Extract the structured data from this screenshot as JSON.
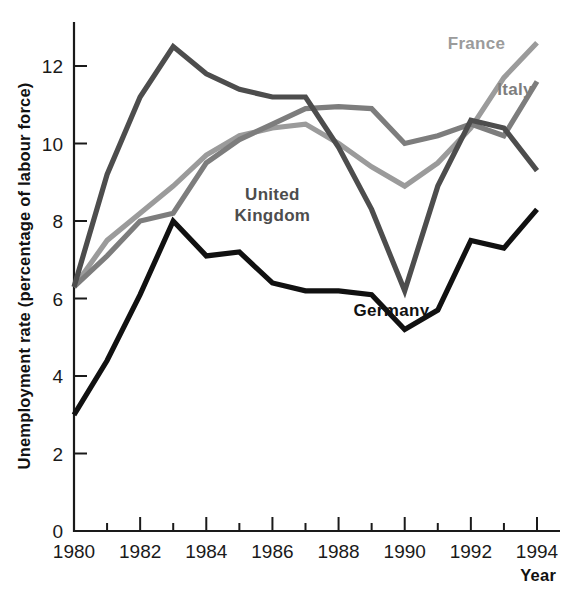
{
  "chart_data": {
    "type": "line",
    "title": "",
    "xlabel": "Year",
    "ylabel": "Unemployment rate (percentage of labour force)",
    "x": [
      1980,
      1981,
      1982,
      1983,
      1984,
      1985,
      1986,
      1987,
      1988,
      1989,
      1990,
      1991,
      1992,
      1993,
      1994
    ],
    "xlim": [
      1980,
      1994
    ],
    "ylim": [
      0,
      13
    ],
    "xticks": [
      1980,
      1982,
      1984,
      1986,
      1988,
      1990,
      1992,
      1994
    ],
    "xtick_labels": [
      "1980",
      "1982",
      "1984",
      "1986",
      "1988",
      "1990",
      "1992",
      "1994"
    ],
    "xticks_minor": [
      1981,
      1983,
      1985,
      1987,
      1989,
      1991,
      1993
    ],
    "yticks": [
      0,
      2,
      4,
      6,
      8,
      10,
      12
    ],
    "ytick_labels": [
      "0",
      "2",
      "4",
      "6",
      "8",
      "10",
      "12"
    ],
    "grid": false,
    "legend": "inline-annotations",
    "series": [
      {
        "name": "United Kingdom",
        "color": "#4d4d4d",
        "label_x": 1986.0,
        "label_y": 8.55,
        "values": [
          6.3,
          9.2,
          11.2,
          12.5,
          11.8,
          11.4,
          11.2,
          11.2,
          9.9,
          8.3,
          6.2,
          8.9,
          10.6,
          10.4,
          9.3
        ]
      },
      {
        "name": "Italy",
        "color": "#7d7d7d",
        "label_x": 1992.8,
        "label_y": 11.25,
        "values": [
          6.3,
          7.1,
          8.0,
          8.2,
          9.5,
          10.1,
          10.5,
          10.9,
          10.95,
          10.9,
          10.0,
          10.2,
          10.5,
          10.2,
          11.6
        ]
      },
      {
        "name": "France",
        "color": "#9b9b9b",
        "label_x": 1991.3,
        "label_y": 12.45,
        "values": [
          6.3,
          7.5,
          8.2,
          8.9,
          9.7,
          10.2,
          10.4,
          10.5,
          10.0,
          9.4,
          8.9,
          9.5,
          10.4,
          11.7,
          12.6
        ]
      },
      {
        "name": "Germany",
        "color": "#111111",
        "label_x": 1989.6,
        "label_y": 5.55,
        "values": [
          3.0,
          4.4,
          6.1,
          8.0,
          7.1,
          7.2,
          6.4,
          6.2,
          6.2,
          6.1,
          5.2,
          5.7,
          7.5,
          7.3,
          8.3
        ]
      }
    ]
  },
  "axis": {
    "y_title": "Unemployment rate (percentage of labour force)",
    "x_title": "Year"
  }
}
